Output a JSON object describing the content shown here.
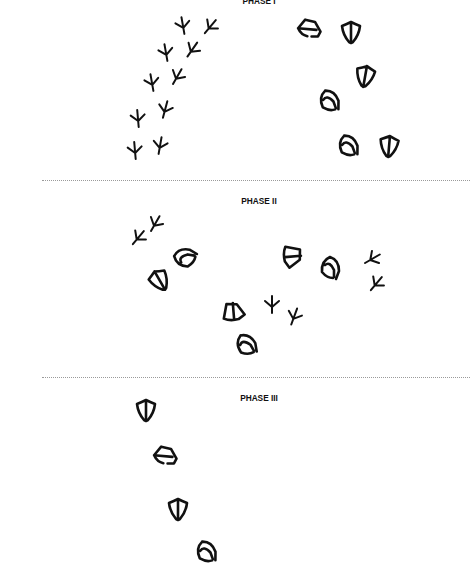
{
  "phases": [
    {
      "title": "PHASE I",
      "bird_tracks": [
        {
          "x": 183,
          "y": 26,
          "rot": -10
        },
        {
          "x": 210,
          "y": 27,
          "rot": 40
        },
        {
          "x": 166,
          "y": 53,
          "rot": -10
        },
        {
          "x": 192,
          "y": 50,
          "rot": 35
        },
        {
          "x": 152,
          "y": 83,
          "rot": -10
        },
        {
          "x": 177,
          "y": 77,
          "rot": 30
        },
        {
          "x": 138,
          "y": 119,
          "rot": -5
        },
        {
          "x": 165,
          "y": 110,
          "rot": 15
        },
        {
          "x": 135,
          "y": 151,
          "rot": -5
        },
        {
          "x": 160,
          "y": 146,
          "rot": 10
        }
      ],
      "duck_tracks": [
        {
          "x": 310,
          "y": 30,
          "rot": -40,
          "kind": "heel"
        },
        {
          "x": 351,
          "y": 33,
          "rot": 0,
          "kind": "web"
        },
        {
          "x": 365,
          "y": 77,
          "rot": 10,
          "kind": "web"
        },
        {
          "x": 329,
          "y": 101,
          "rot": -20,
          "kind": "toe"
        },
        {
          "x": 348,
          "y": 146,
          "rot": -20,
          "kind": "toe"
        },
        {
          "x": 389,
          "y": 147,
          "rot": 5,
          "kind": "web"
        }
      ]
    },
    {
      "title": "PHASE II",
      "bird_tracks": [
        {
          "x": 138,
          "y": 238,
          "rot": 40
        },
        {
          "x": 155,
          "y": 224,
          "rot": 30
        },
        {
          "x": 372,
          "y": 259,
          "rot": 60
        },
        {
          "x": 376,
          "y": 284,
          "rot": 40
        },
        {
          "x": 272,
          "y": 305,
          "rot": 0
        },
        {
          "x": 294,
          "y": 317,
          "rot": 20
        }
      ],
      "duck_tracks": [
        {
          "x": 185,
          "y": 258,
          "rot": -80,
          "kind": "toe"
        },
        {
          "x": 160,
          "y": 281,
          "rot": -30,
          "kind": "web"
        },
        {
          "x": 291,
          "y": 257,
          "rot": 30,
          "kind": "heel-web"
        },
        {
          "x": 330,
          "y": 268,
          "rot": 0,
          "kind": "toe"
        },
        {
          "x": 234,
          "y": 313,
          "rot": -60,
          "kind": "heel-web"
        },
        {
          "x": 246,
          "y": 345,
          "rot": -30,
          "kind": "toe"
        }
      ]
    },
    {
      "title": "PHASE III",
      "bird_tracks": [],
      "duck_tracks": [
        {
          "x": 146,
          "y": 411,
          "rot": 0,
          "kind": "web"
        },
        {
          "x": 166,
          "y": 457,
          "rot": -40,
          "kind": "heel"
        },
        {
          "x": 178,
          "y": 510,
          "rot": 0,
          "kind": "web"
        },
        {
          "x": 206,
          "y": 552,
          "rot": -20,
          "kind": "toe"
        }
      ]
    }
  ],
  "colors": {
    "ink": "#111111",
    "divider": "#9a9a9a",
    "background": "#ffffff"
  }
}
